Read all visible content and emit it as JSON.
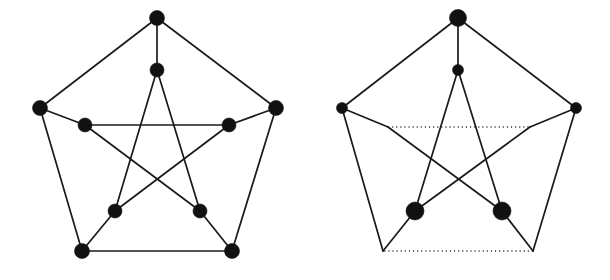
{
  "figure": {
    "background_color": "#ffffff",
    "ink_color": "#1a1a1a",
    "node_color": "#111111",
    "width": 610,
    "height": 280,
    "panels": [
      {
        "id": "left-graph",
        "name": "petersen-graph-full",
        "caption": "",
        "node_count": 10,
        "edge_count": 15,
        "nodes": [
          {
            "id": "o0",
            "label": "outer-top",
            "x": 157,
            "y": 18,
            "r": 7.5,
            "kind": "outer",
            "visible": true
          },
          {
            "id": "o1",
            "label": "outer-right",
            "x": 276,
            "y": 108,
            "r": 7.5,
            "kind": "outer",
            "visible": true
          },
          {
            "id": "o2",
            "label": "outer-bottom-right",
            "x": 232,
            "y": 251,
            "r": 7.5,
            "kind": "outer",
            "visible": true
          },
          {
            "id": "o3",
            "label": "outer-bottom-left",
            "x": 82,
            "y": 251,
            "r": 7.5,
            "kind": "outer",
            "visible": true
          },
          {
            "id": "o4",
            "label": "outer-left",
            "x": 40,
            "y": 108,
            "r": 7.5,
            "kind": "outer",
            "visible": true
          },
          {
            "id": "i0",
            "label": "inner-top",
            "x": 157,
            "y": 70,
            "r": 7.0,
            "kind": "inner",
            "visible": true
          },
          {
            "id": "i1",
            "label": "inner-right",
            "x": 229,
            "y": 125,
            "r": 7.0,
            "kind": "inner",
            "visible": true
          },
          {
            "id": "i2",
            "label": "inner-bottom-right",
            "x": 200,
            "y": 211,
            "r": 7.0,
            "kind": "inner",
            "visible": true
          },
          {
            "id": "i3",
            "label": "inner-bottom-left",
            "x": 115,
            "y": 211,
            "r": 7.0,
            "kind": "inner",
            "visible": true
          },
          {
            "id": "i4",
            "label": "inner-left",
            "x": 85,
            "y": 125,
            "r": 7.0,
            "kind": "inner",
            "visible": true
          }
        ],
        "edges": [
          {
            "from": "o0",
            "to": "o1",
            "style": "solid",
            "group": "outer-cycle"
          },
          {
            "from": "o1",
            "to": "o2",
            "style": "solid",
            "group": "outer-cycle"
          },
          {
            "from": "o2",
            "to": "o3",
            "style": "solid",
            "group": "outer-cycle"
          },
          {
            "from": "o3",
            "to": "o4",
            "style": "solid",
            "group": "outer-cycle"
          },
          {
            "from": "o4",
            "to": "o0",
            "style": "solid",
            "group": "outer-cycle"
          },
          {
            "from": "o0",
            "to": "i0",
            "style": "solid",
            "group": "spoke"
          },
          {
            "from": "o1",
            "to": "i1",
            "style": "solid",
            "group": "spoke"
          },
          {
            "from": "o2",
            "to": "i2",
            "style": "solid",
            "group": "spoke"
          },
          {
            "from": "o3",
            "to": "i3",
            "style": "solid",
            "group": "spoke"
          },
          {
            "from": "o4",
            "to": "i4",
            "style": "solid",
            "group": "spoke"
          },
          {
            "from": "i0",
            "to": "i2",
            "style": "solid",
            "group": "pentagram"
          },
          {
            "from": "i2",
            "to": "i4",
            "style": "solid",
            "group": "pentagram"
          },
          {
            "from": "i4",
            "to": "i1",
            "style": "solid",
            "group": "pentagram"
          },
          {
            "from": "i1",
            "to": "i3",
            "style": "solid",
            "group": "pentagram"
          },
          {
            "from": "i3",
            "to": "i0",
            "style": "solid",
            "group": "pentagram"
          }
        ]
      },
      {
        "id": "right-graph",
        "name": "petersen-graph-reduced",
        "caption": "",
        "node_count": 6,
        "edge_count": 15,
        "nodes": [
          {
            "id": "o0",
            "label": "outer-top",
            "x": 458,
            "y": 18,
            "r": 8.5,
            "kind": "outer",
            "visible": true
          },
          {
            "id": "o1",
            "label": "outer-right",
            "x": 576,
            "y": 108,
            "r": 5.5,
            "kind": "outer",
            "visible": true
          },
          {
            "id": "o2",
            "label": "outer-bottom-right",
            "x": 533,
            "y": 251,
            "r": 0,
            "kind": "corner",
            "visible": false
          },
          {
            "id": "o3",
            "label": "outer-bottom-left",
            "x": 383,
            "y": 251,
            "r": 0,
            "kind": "corner",
            "visible": false
          },
          {
            "id": "o4",
            "label": "outer-left",
            "x": 342,
            "y": 108,
            "r": 5.5,
            "kind": "outer",
            "visible": true
          },
          {
            "id": "i0",
            "label": "inner-top",
            "x": 458,
            "y": 70,
            "r": 5.5,
            "kind": "inner",
            "visible": true
          },
          {
            "id": "i1",
            "label": "inner-right",
            "x": 530,
            "y": 127,
            "r": 0,
            "kind": "corner",
            "visible": false
          },
          {
            "id": "i2",
            "label": "inner-bottom-right",
            "x": 502,
            "y": 211,
            "r": 9.0,
            "kind": "inner",
            "visible": true
          },
          {
            "id": "i3",
            "label": "inner-bottom-left",
            "x": 415,
            "y": 211,
            "r": 9.0,
            "kind": "inner",
            "visible": true
          },
          {
            "id": "i4",
            "label": "inner-left",
            "x": 388,
            "y": 127,
            "r": 0,
            "kind": "corner",
            "visible": false
          }
        ],
        "edges": [
          {
            "from": "o0",
            "to": "o1",
            "style": "solid",
            "group": "outer-cycle"
          },
          {
            "from": "o1",
            "to": "o2",
            "style": "solid",
            "group": "outer-cycle"
          },
          {
            "from": "o2",
            "to": "o3",
            "style": "dotted",
            "group": "outer-cycle"
          },
          {
            "from": "o3",
            "to": "o4",
            "style": "solid",
            "group": "outer-cycle"
          },
          {
            "from": "o4",
            "to": "o0",
            "style": "solid",
            "group": "outer-cycle"
          },
          {
            "from": "o0",
            "to": "i0",
            "style": "solid",
            "group": "spoke"
          },
          {
            "from": "o1",
            "to": "i1",
            "style": "solid",
            "group": "spoke"
          },
          {
            "from": "o2",
            "to": "i2",
            "style": "solid",
            "group": "spoke"
          },
          {
            "from": "o3",
            "to": "i3",
            "style": "solid",
            "group": "spoke"
          },
          {
            "from": "o4",
            "to": "i4",
            "style": "solid",
            "group": "spoke"
          },
          {
            "from": "i0",
            "to": "i2",
            "style": "solid",
            "group": "pentagram"
          },
          {
            "from": "i2",
            "to": "i4",
            "style": "solid",
            "group": "pentagram"
          },
          {
            "from": "i4",
            "to": "i1",
            "style": "dotted",
            "group": "pentagram"
          },
          {
            "from": "i1",
            "to": "i3",
            "style": "solid",
            "group": "pentagram"
          },
          {
            "from": "i3",
            "to": "i0",
            "style": "solid",
            "group": "pentagram"
          }
        ]
      }
    ]
  }
}
